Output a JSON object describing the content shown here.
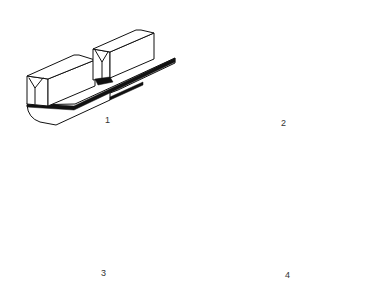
{
  "figures": [
    {
      "id": 1,
      "label": "1",
      "description": "Block with V-notched twin ridges and dark base strip"
    },
    {
      "id": 2,
      "label": "2",
      "description": "Block with prism (triangular) twin ridges"
    },
    {
      "id": 3,
      "label": "3",
      "description": "Block with rounded triangular ridges with small slot"
    },
    {
      "id": 4,
      "label": "4",
      "description": "Side cross-section view on base plates"
    }
  ],
  "colors": {
    "line": "#111111",
    "background": "#ffffff"
  }
}
